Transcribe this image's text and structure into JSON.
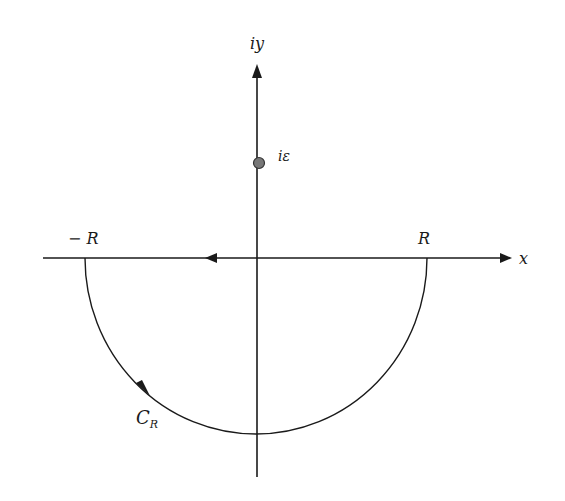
{
  "diagram": {
    "type": "complex-plane-contour",
    "axes": {
      "x_label": "x",
      "y_label": "iy"
    },
    "points": {
      "pole_label": "iε",
      "minus_r_label": "− R",
      "r_label": "R"
    },
    "contour": {
      "label_main": "C",
      "label_sub": "R",
      "description": "Lower semicircle of radius R from R through bottom to −R, closed along real axis from R to −R direction arrow pointing left"
    },
    "colors": {
      "line": "#1a1a1a",
      "pole_fill": "#777777",
      "background": "#ffffff"
    }
  }
}
